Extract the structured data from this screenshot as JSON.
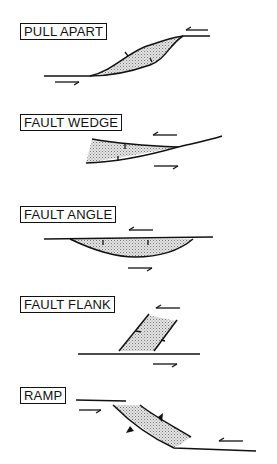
{
  "figure": {
    "panels": [
      {
        "id": "pull-apart",
        "label": "PULL APART"
      },
      {
        "id": "fault-wedge",
        "label": "FAULT WEDGE"
      },
      {
        "id": "fault-angle",
        "label": "FAULT ANGLE"
      },
      {
        "id": "fault-flank",
        "label": "FAULT FLANK"
      },
      {
        "id": "ramp",
        "label": "RAMP"
      }
    ],
    "colors": {
      "line": "#111111",
      "fill": "#c8c8c8",
      "background": "#ffffff"
    }
  }
}
